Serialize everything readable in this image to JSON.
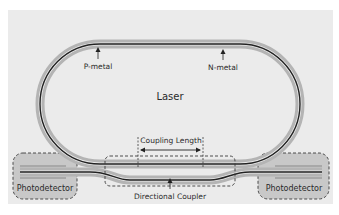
{
  "diagram": {
    "title": "Laser",
    "labels": {
      "p_metal": "P-metal",
      "n_metal": "N-metal",
      "laser": "Laser",
      "coupling_length": "Coupling Length",
      "directional_coupler": "Directional Coupler",
      "photodetector_left": "Photodetector",
      "photodetector_right": "Photodetector"
    },
    "colors": {
      "background_panel": "#ebebeb",
      "cladding": "#b4b4b4",
      "waveguide_core": "#222222",
      "photodetector_fill": "#c8c8c8",
      "dashed_outline": "#3a3a3a",
      "text": "#2a2a2a"
    }
  }
}
